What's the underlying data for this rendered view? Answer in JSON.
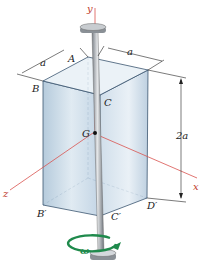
{
  "figure": {
    "points": {
      "A": "A",
      "B": "B",
      "C": "C",
      "G": "G",
      "B_prime": "B′",
      "C_prime": "C′",
      "D_prime": "D′"
    },
    "axes": {
      "x": "x",
      "y": "y",
      "z": "z"
    },
    "dimensions": {
      "width_left": "a",
      "width_right": "a",
      "height": "2a"
    },
    "rotation": {
      "symbol": "ω"
    },
    "colors": {
      "axis": "#d9534f",
      "rotation_arrow": "#1f8a4c",
      "box_face": "#b9cfe0",
      "rod": "#9aa0a6"
    }
  }
}
